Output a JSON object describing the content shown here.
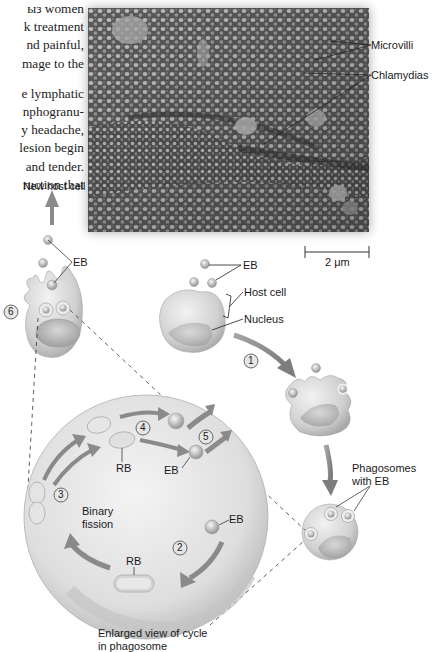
{
  "body_text": {
    "lines": [
      "ыз women",
      "k treatment",
      "nd painful,",
      "mage to the",
      "",
      "e lymphatic",
      "nphogranu-",
      "y headache,",
      "lesion begin",
      "and tender.",
      "ruction that"
    ]
  },
  "micrograph": {
    "labels": {
      "microvilli": "Microvilli",
      "chlamydias": "Chlamydias"
    },
    "scale_bar": "2 μm"
  },
  "diagram": {
    "labels": {
      "new_host_cell": "New host cell",
      "eb_top_left": "EB",
      "eb_top_right": "EB",
      "host_cell": "Host cell",
      "nucleus": "Nucleus",
      "phagosomes_line1": "Phagosomes",
      "phagosomes_line2": "with EB",
      "rb_upper": "RB",
      "eb_inner_1": "EB",
      "eb_inner_2": "EB",
      "rb_lower": "RB",
      "binary_line1": "Binary",
      "binary_line2": "fission",
      "enlarged_line1": "Enlarged view of cycle",
      "enlarged_line2": "in phagosome"
    },
    "steps": [
      "1",
      "2",
      "3",
      "4",
      "5",
      "6"
    ]
  }
}
